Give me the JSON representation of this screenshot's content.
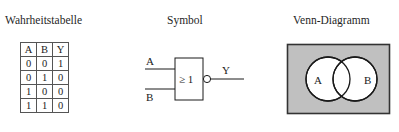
{
  "panels": {
    "truth_table": {
      "title": "Wahrheitstabelle",
      "columns": [
        "A",
        "B",
        "Y"
      ],
      "rows": [
        [
          "0",
          "0",
          "1"
        ],
        [
          "0",
          "1",
          "0"
        ],
        [
          "1",
          "0",
          "0"
        ],
        [
          "1",
          "1",
          "0"
        ]
      ]
    },
    "symbol": {
      "title": "Symbol",
      "gate_operator": "≥ 1",
      "input_a_label": "A",
      "input_b_label": "B",
      "output_label": "Y",
      "inverting_bubble": "negation-bubble"
    },
    "venn": {
      "title": "Venn-Diagramm",
      "circle_a_label": "A",
      "circle_b_label": "B",
      "shaded_region_color": "#c0c0c0",
      "circle_fill_color": "#ffffff",
      "outline_color": "#1a1a1a"
    }
  },
  "colors": {
    "background": "#ffffff",
    "ink": "#1a1a1a",
    "table_border": "#555555",
    "venn_shade": "#c0c0c0"
  }
}
